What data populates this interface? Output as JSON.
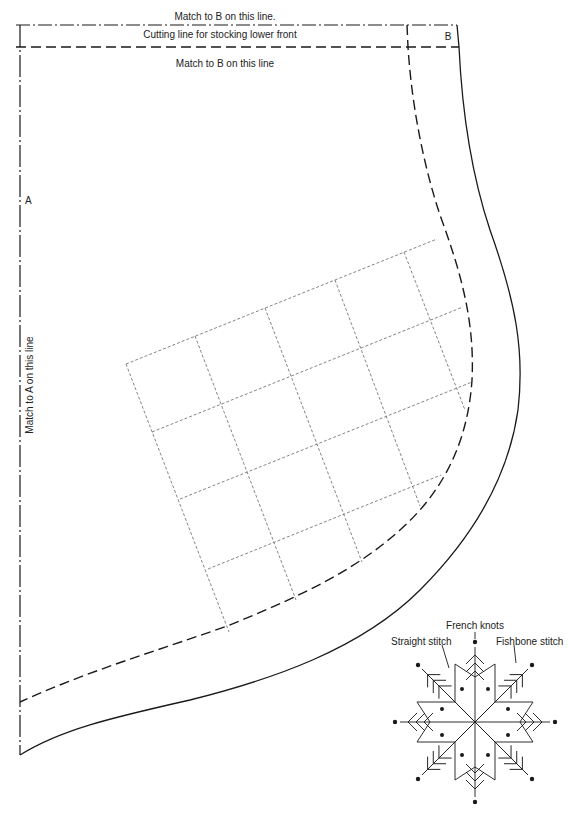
{
  "pattern": {
    "title_top": "Match to B on this line.",
    "cutting_line_label": "Cutting line for stocking lower front",
    "match_b_label": "Match to B on this line",
    "marker_b": "B",
    "marker_a": "A",
    "match_a_label": "Match to A on this line"
  },
  "snowflake": {
    "labels": {
      "french_knots": "French knots",
      "straight_stitch": "Straight stitch",
      "fishbone_stitch": "Fishbone stitch"
    }
  },
  "colors": {
    "line": "#1a1a1a",
    "grid": "#777777",
    "background": "#ffffff"
  }
}
